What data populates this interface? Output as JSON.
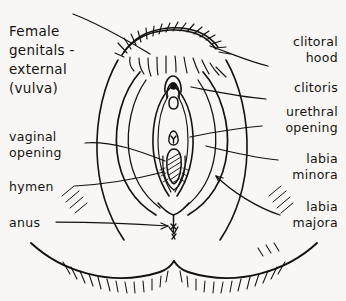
{
  "figure": {
    "title": "Female\ngenitals -\nexternal\n(vulva)",
    "style": "hand-drawn ink line illustration",
    "ink_color": "#14120f",
    "paper_color": "#f8f7f5"
  },
  "labels_left": [
    {
      "id": "vaginal-opening",
      "text": "vaginal\nopening"
    },
    {
      "id": "hymen",
      "text": "hymen"
    },
    {
      "id": "anus",
      "text": "anus"
    }
  ],
  "labels_right": [
    {
      "id": "clitoral-hood",
      "text": "clitoral\nhood"
    },
    {
      "id": "clitoris",
      "text": "clitoris"
    },
    {
      "id": "urethral-opening",
      "text": "urethral\nopening"
    },
    {
      "id": "labia-minora",
      "text": "labia\nminora"
    },
    {
      "id": "labia-majora",
      "text": "labia\nmajora"
    }
  ],
  "parts": [
    "pubic-hair",
    "mons-pubis",
    "clitoral-hood",
    "clitoris",
    "urethral-opening",
    "labia-minora",
    "labia-majora",
    "vaginal-opening",
    "hymen",
    "perineum",
    "anus",
    "buttocks"
  ]
}
